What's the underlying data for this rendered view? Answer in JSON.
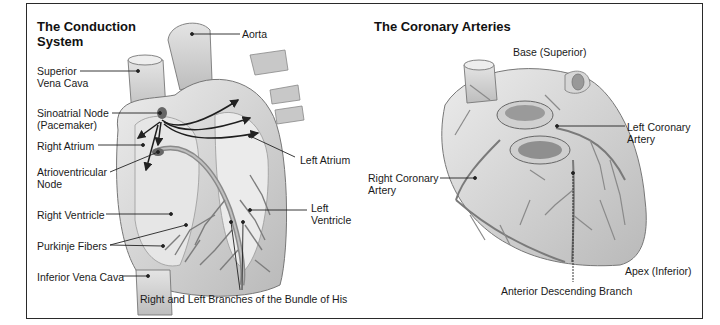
{
  "panels": {
    "conduction": {
      "title_line1": "The Conduction",
      "title_line2": "System",
      "labels": {
        "aorta": "Aorta",
        "superior_vena_cava_1": "Superior",
        "superior_vena_cava_2": "Vena Cava",
        "sinoatrial_node_1": "Sinoatrial Node",
        "sinoatrial_node_2": "(Pacemaker)",
        "right_atrium": "Right Atrium",
        "atrioventricular_node_1": "Atrioventricular",
        "atrioventricular_node_2": "Node",
        "left_atrium": "Left Atrium",
        "left_ventricle_1": "Left",
        "left_ventricle_2": "Ventricle",
        "right_ventricle": "Right Ventricle",
        "purkinje_fibers": "Purkinje Fibers",
        "inferior_vena_cava": "Inferior Vena Cava",
        "bundle_of_his": "Right and Left Branches of the Bundle of His"
      }
    },
    "coronary": {
      "title": "The Coronary Arteries",
      "labels": {
        "base": "Base (Superior)",
        "left_coronary_1": "Left Coronary",
        "left_coronary_2": "Artery",
        "right_coronary_1": "Right Coronary",
        "right_coronary_2": "Artery",
        "apex": "Apex (Inferior)",
        "anterior_descending": "Anterior Descending Branch"
      }
    }
  },
  "colors": {
    "frame": "#2a2a2a",
    "heart_fill": "#d9d9d9",
    "heart_shade": "#a8a8a8",
    "vessel": "#7a7a7a",
    "leader": "#222222"
  }
}
